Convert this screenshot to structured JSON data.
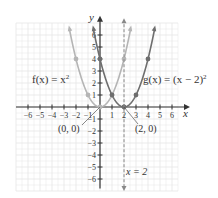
{
  "chart_data": {
    "type": "line",
    "title": "",
    "xlabel": "x",
    "ylabel": "y",
    "xlim": [
      -6,
      6
    ],
    "ylim": [
      -6,
      6
    ],
    "grid": true,
    "x_ticks": [
      -6,
      -5,
      -4,
      -3,
      -2,
      -1,
      1,
      2,
      3,
      4,
      5,
      6
    ],
    "y_ticks": [
      -6,
      -5,
      -4,
      -3,
      -2,
      -1,
      1,
      2,
      3,
      4,
      5,
      6
    ],
    "x_tick_labels": [
      "−6",
      "−5",
      "−4",
      "−3",
      "−2",
      "−1",
      "1",
      "2",
      "3",
      "4",
      "5",
      "6"
    ],
    "y_tick_labels": [
      "−6",
      "−5",
      "−4",
      "−3",
      "−2",
      "−1",
      "1",
      "2",
      "3",
      "4",
      "5",
      "6"
    ],
    "series": [
      {
        "name": "f(x) = x^2",
        "label_text": "f(x) = x",
        "label_sup": "2",
        "color": "#b5b5b5",
        "points": [
          [
            -2.5,
            6.25
          ],
          [
            -2,
            4
          ],
          [
            -1,
            1
          ],
          [
            0,
            0
          ],
          [
            1,
            1
          ],
          [
            2,
            4
          ],
          [
            2.5,
            6.25
          ]
        ],
        "markers": [
          [
            -2,
            4
          ],
          [
            -1,
            1
          ],
          [
            0,
            0
          ],
          [
            1,
            1
          ],
          [
            2,
            4
          ]
        ]
      },
      {
        "name": "g(x) = (x - 2)^2",
        "label_text": "g(x) = (x − 2)",
        "label_sup": "2",
        "color": "#6e6e6e",
        "points": [
          [
            -0.5,
            6.25
          ],
          [
            0,
            4
          ],
          [
            1,
            1
          ],
          [
            2,
            0
          ],
          [
            3,
            1
          ],
          [
            4,
            4
          ],
          [
            4.5,
            6.25
          ]
        ],
        "markers": [
          [
            0,
            4
          ],
          [
            1,
            1
          ],
          [
            2,
            0
          ],
          [
            3,
            1
          ],
          [
            4,
            4
          ]
        ]
      }
    ],
    "annotations": [
      {
        "text": "(0, 0)",
        "point": [
          0,
          0
        ]
      },
      {
        "text": "(2, 0)",
        "point": [
          2,
          0
        ]
      },
      {
        "text": "x = 2",
        "type": "vertical-dashed-line",
        "x": 2
      }
    ]
  },
  "labels": {
    "x_axis": "x",
    "y_axis": "y",
    "f_label": "f(x) = x",
    "f_sup": "2",
    "g_label": "g(x) = (x − 2)",
    "g_sup": "2",
    "vertex_f": "(0, 0)",
    "vertex_g": "(2, 0)",
    "asymptote": "x = 2"
  },
  "colors": {
    "grid": "#e6e6e6",
    "axis": "#333333",
    "f_curve": "#b5b5b5",
    "g_curve": "#6e6e6e",
    "dashed_line": "#888888"
  }
}
